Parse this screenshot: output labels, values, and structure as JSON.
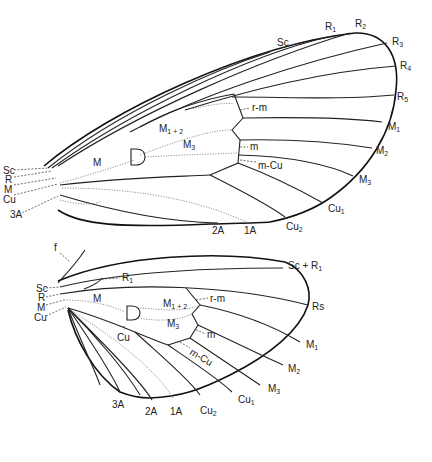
{
  "forewing": {
    "labels": {
      "Sc_tip": "Sc",
      "R1": "R",
      "R1_sub": "1",
      "R2": "R",
      "R2_sub": "2",
      "R3": "R",
      "R3_sub": "3",
      "R4": "R",
      "R4_sub": "4",
      "R5": "R",
      "R5_sub": "5",
      "M1": "M",
      "M1_sub": "1",
      "M2": "M",
      "M2_sub": "2",
      "M3_edge": "M",
      "M3_edge_sub": "3",
      "Cu1": "Cu",
      "Cu1_sub": "1",
      "Cu2": "Cu",
      "Cu2_sub": "2",
      "A2": "2A",
      "A1": "1A",
      "rm": "r-m",
      "m": "m",
      "mCu": "m-Cu",
      "M12": "M",
      "M12_sub": "1 + 2",
      "M3": "M",
      "M3_sub": "3",
      "M": "M",
      "D": "D",
      "base_Sc": "Sc",
      "base_R": "R",
      "base_M": "M",
      "base_Cu": "Cu",
      "base_3A": "3A"
    }
  },
  "hindwing": {
    "labels": {
      "f": "f",
      "ScR1": "Sc + R",
      "ScR1_sub": "1",
      "Rs": "Rs",
      "R1": "R",
      "R1_sub": "1",
      "M": "M",
      "M12": "M",
      "M12_sub": "1 + 2",
      "M3": "M",
      "M3_sub": "3",
      "Cu": "Cu",
      "D": "D",
      "rm": "r-m",
      "m": "m",
      "mCu": "m-Cu",
      "M1": "M",
      "M1_sub": "1",
      "M2": "M",
      "M2_sub": "2",
      "M3_edge": "M",
      "M3_edge_sub": "3",
      "Cu1": "Cu",
      "Cu1_sub": "1",
      "Cu2": "Cu",
      "Cu2_sub": "2",
      "A3": "3A",
      "A2": "2A",
      "A1": "1A",
      "base_Sc": "Sc",
      "base_R": "R",
      "base_M": "M",
      "base_Cu": "Cu"
    }
  }
}
